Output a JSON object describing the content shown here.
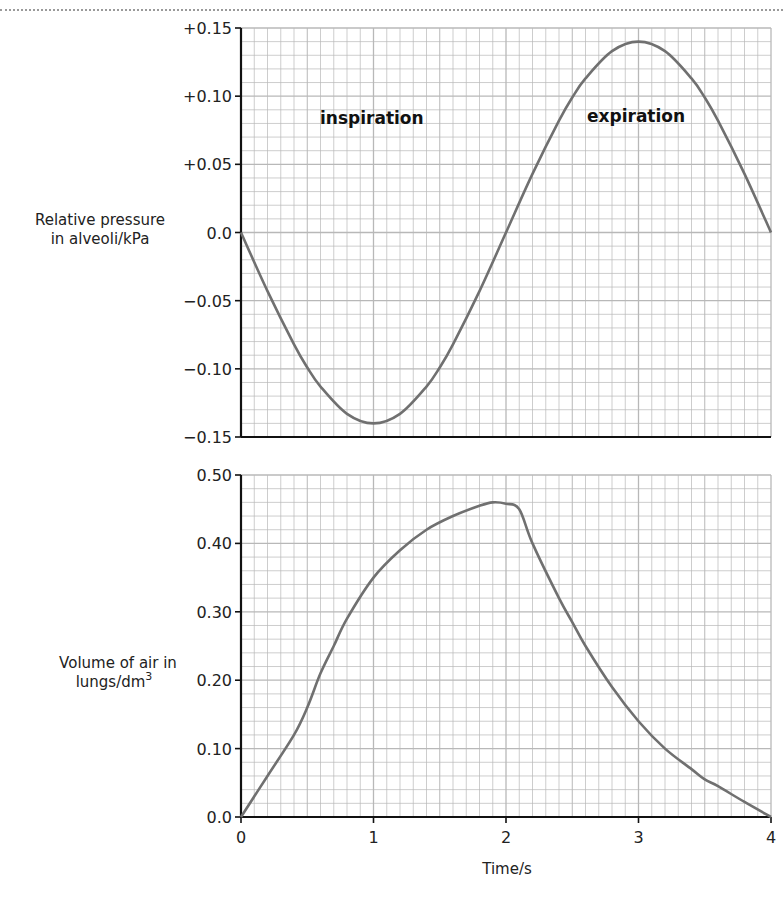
{
  "chart_data": [
    {
      "type": "line",
      "title": "",
      "xlabel": "Time/s",
      "ylabel": "Relative pressure in alveoli/kPa",
      "ylabel_lines": [
        "Relative pressure",
        "in alveoli/kPa"
      ],
      "xlim": [
        0,
        4
      ],
      "ylim": [
        -0.15,
        0.15
      ],
      "grid": true,
      "y_ticks": [
        "+0.15",
        "+0.10",
        "+0.05",
        "0.0",
        "−0.05",
        "−0.10",
        "−0.15"
      ],
      "y_tick_values": [
        0.15,
        0.1,
        0.05,
        0.0,
        -0.05,
        -0.1,
        -0.15
      ],
      "annotations": [
        {
          "text": "inspiration",
          "x": 0.75,
          "y": 0.085
        },
        {
          "text": "expiration",
          "x": 2.75,
          "y": 0.085
        }
      ],
      "series": [
        {
          "name": "Relative pressure in alveoli",
          "x": [
            0,
            0.2,
            0.4,
            0.5,
            0.6,
            0.8,
            1.0,
            1.2,
            1.4,
            1.5,
            1.6,
            1.8,
            2.0,
            2.2,
            2.4,
            2.5,
            2.6,
            2.8,
            3.0,
            3.2,
            3.4,
            3.5,
            3.6,
            3.8,
            4.0
          ],
          "values": [
            0.0,
            -0.043,
            -0.082,
            -0.099,
            -0.113,
            -0.133,
            -0.14,
            -0.133,
            -0.113,
            -0.099,
            -0.082,
            -0.043,
            0.0,
            0.043,
            0.082,
            0.099,
            0.113,
            0.133,
            0.14,
            0.133,
            0.113,
            0.099,
            0.082,
            0.043,
            0.0
          ]
        }
      ]
    },
    {
      "type": "line",
      "title": "",
      "xlabel": "Time/s",
      "ylabel": "Volume of air in lungs/dm3",
      "ylabel_lines": [
        "Volume of air in",
        "lungs/dm"
      ],
      "ylabel_superscript": "3",
      "xlim": [
        0,
        4
      ],
      "ylim": [
        0.0,
        0.5
      ],
      "grid": true,
      "x_ticks": [
        "0",
        "1",
        "2",
        "3",
        "4"
      ],
      "y_ticks": [
        "0.50",
        "0.40",
        "0.30",
        "0.20",
        "0.10",
        "0.0"
      ],
      "y_tick_values": [
        0.5,
        0.4,
        0.3,
        0.2,
        0.1,
        0.0
      ],
      "series": [
        {
          "name": "Volume of air in lungs",
          "x": [
            0,
            0.2,
            0.4,
            0.5,
            0.6,
            0.7,
            0.8,
            1.0,
            1.2,
            1.4,
            1.6,
            1.8,
            1.9,
            2.0,
            2.1,
            2.2,
            2.4,
            2.5,
            2.6,
            2.8,
            3.0,
            3.2,
            3.4,
            3.5,
            3.6,
            3.8,
            4.0
          ],
          "values": [
            0.0,
            0.06,
            0.12,
            0.16,
            0.21,
            0.25,
            0.29,
            0.35,
            0.39,
            0.42,
            0.44,
            0.455,
            0.46,
            0.458,
            0.45,
            0.4,
            0.32,
            0.285,
            0.25,
            0.19,
            0.14,
            0.1,
            0.07,
            0.055,
            0.045,
            0.022,
            0.0
          ]
        }
      ]
    }
  ],
  "labels": {
    "top_ylabel_line1": "Relative pressure",
    "top_ylabel_line2": "in alveoli/kPa",
    "bottom_ylabel_line1": "Volume of air in",
    "bottom_ylabel_line2": "lungs/dm",
    "bottom_ylabel_sup": "3",
    "inspiration": "inspiration",
    "expiration": "expiration",
    "xlabel": "Time/s"
  },
  "colors": {
    "curve": "#707070",
    "axis": "#111111",
    "grid": "#b8b8b8"
  }
}
